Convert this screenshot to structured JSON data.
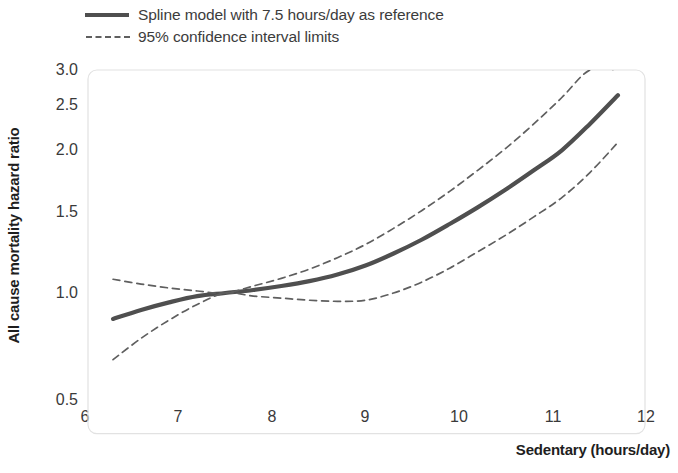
{
  "figure": {
    "background_color": "#ffffff",
    "line_color": "#4f4f4f",
    "ci_color": "#5f5f5f",
    "frame_color": "#e2e2e2"
  },
  "legend": {
    "items": [
      {
        "label": "Spline model with 7.5 hours/day as reference",
        "style": "solid"
      },
      {
        "label": "95% confidence interval limits",
        "style": "dashed"
      }
    ]
  },
  "axes": {
    "y_title": "All cause mortality hazard ratio",
    "x_title": "Sedentary (hours/day)",
    "y_ticks": [
      "3.0",
      "2.5",
      "2.0",
      "1.5",
      "1.0",
      "0.5"
    ],
    "x_ticks": [
      "6",
      "7",
      "8",
      "9",
      "10",
      "11",
      "12"
    ]
  },
  "chart_data": {
    "type": "line",
    "title": "",
    "subtitle": "",
    "xlabel": "Sedentary (hours/day)",
    "ylabel": "All cause mortality hazard ratio",
    "xlim": [
      6,
      12
    ],
    "ylim": [
      0.5,
      3.0
    ],
    "yscale": "log",
    "xscale": "linear",
    "grid": false,
    "legend_position": "above-plot-left",
    "reference_x": 7.5,
    "reference_y": 1.0,
    "annotations": [],
    "x": [
      6.3,
      6.6,
      6.9,
      7.2,
      7.5,
      7.8,
      8.1,
      8.4,
      8.7,
      9.0,
      9.3,
      9.6,
      9.9,
      10.2,
      10.5,
      10.8,
      11.1,
      11.4,
      11.7
    ],
    "series": [
      {
        "name": "Spline model with 7.5 hours/day as reference",
        "style": "solid",
        "values": [
          0.88,
          0.92,
          0.955,
          0.985,
          1.0,
          1.015,
          1.035,
          1.06,
          1.095,
          1.145,
          1.215,
          1.3,
          1.405,
          1.525,
          1.665,
          1.83,
          2.02,
          2.3,
          2.65
        ]
      },
      {
        "name": "95% confidence interval upper limit",
        "style": "dashed",
        "values": [
          1.07,
          1.045,
          1.025,
          1.01,
          1.0,
          1.035,
          1.075,
          1.125,
          1.19,
          1.27,
          1.375,
          1.5,
          1.65,
          1.83,
          2.04,
          2.3,
          2.62,
          3.0,
          3.0
        ]
      },
      {
        "name": "95% confidence interval lower limit",
        "style": "dashed",
        "values": [
          0.72,
          0.8,
          0.875,
          0.945,
          1.0,
          0.985,
          0.975,
          0.965,
          0.96,
          0.965,
          1.0,
          1.055,
          1.13,
          1.225,
          1.33,
          1.455,
          1.6,
          1.81,
          2.1
        ]
      }
    ]
  }
}
